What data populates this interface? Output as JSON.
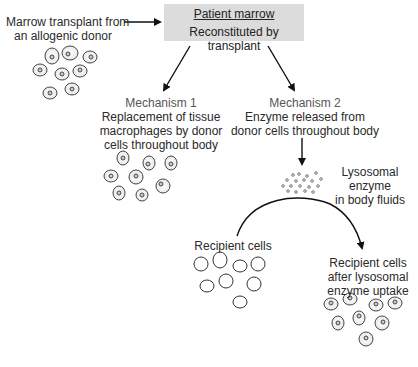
{
  "donor": {
    "label_line1": "Marrow transplant from",
    "label_line2": "an allogenic donor"
  },
  "patient_box": {
    "title": "Patient marrow",
    "subtitle": "Reconstituted by transplant",
    "fill_color": "#dcdcdc"
  },
  "mechanism1": {
    "title": "Mechanism 1",
    "line1": "Replacement of tissue",
    "line2": "macrophages by donor",
    "line3": "cells throughout body"
  },
  "mechanism2": {
    "title": "Mechanism 2",
    "line1": "Enzyme released from",
    "line2": "donor cells throughout body"
  },
  "enzyme": {
    "line1": "Lysosomal",
    "line2": "enzyme",
    "line3": "in body fluids"
  },
  "recipient": {
    "label": "Recipient cells"
  },
  "recipient_after": {
    "line1": "Recipient cells",
    "line2": "after lysosomal",
    "line3": "enzyme uptake"
  }
}
